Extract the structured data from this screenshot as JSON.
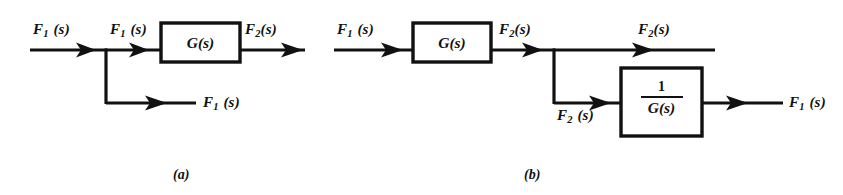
{
  "figure": {
    "type": "block-diagram-pair",
    "background_color": "#ffffff",
    "line_color": "#111111"
  },
  "diagram_a": {
    "caption": "(a)",
    "input_label": "F",
    "input_sub": "1",
    "input_arg": "(s)",
    "labels": {
      "input": "F₁ (s)",
      "after_branch": "F₁ (s)",
      "output": "F₂ (s)",
      "branch_output": "F₁ (s)"
    },
    "blocks": [
      {
        "name": "g-block",
        "text": "G(s)"
      }
    ]
  },
  "diagram_b": {
    "caption": "(b)",
    "labels": {
      "input": "F₁ (s)",
      "after_block": "F₂ (s)",
      "top_output": "F₂ (s)",
      "branch_label": "F₂ (s)",
      "final_output": "F₁ (s)"
    },
    "blocks": [
      {
        "name": "g-block",
        "text": "G(s)"
      },
      {
        "name": "inverse-g-block",
        "numerator": "1",
        "denominator": "G(s)"
      }
    ]
  },
  "text_parts": {
    "F": "F",
    "sub1": "1",
    "sub2": "2",
    "arg": "(s)",
    "G_of_s": "G(s)",
    "one": "1",
    "caption_a": "(a)",
    "caption_b": "(b)"
  }
}
